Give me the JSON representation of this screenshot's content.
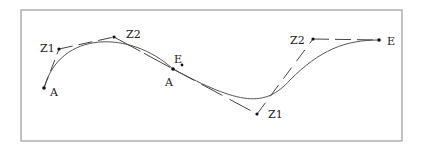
{
  "diagram": {
    "type": "bezier-curve-construction",
    "colors": {
      "frame": "#9a9a9a",
      "curve": "#444444",
      "handle": "#444444",
      "point": "#111111",
      "text": "#222222"
    },
    "segments": [
      {
        "start": {
          "label": "A",
          "x": 44,
          "y": 88
        },
        "control1": {
          "label": "Z1",
          "x": 59,
          "y": 49
        },
        "control2": {
          "label": "Z2",
          "x": 114,
          "y": 37
        },
        "end": {
          "label": "E",
          "x": 181,
          "y": 65
        }
      },
      {
        "start": {
          "label": "A",
          "x": 173,
          "y": 69
        },
        "control1": {
          "label": "Z1",
          "x": 257,
          "y": 114
        },
        "control2": {
          "label": "Z2",
          "x": 313,
          "y": 39
        },
        "end": {
          "label": "E",
          "x": 379,
          "y": 40
        }
      }
    ],
    "labels": {
      "a1": "A",
      "z1_1": "Z1",
      "z2_1": "Z2",
      "e1": "E",
      "a2": "A",
      "z1_2": "Z1",
      "z2_2": "Z2",
      "e2": "E"
    }
  }
}
